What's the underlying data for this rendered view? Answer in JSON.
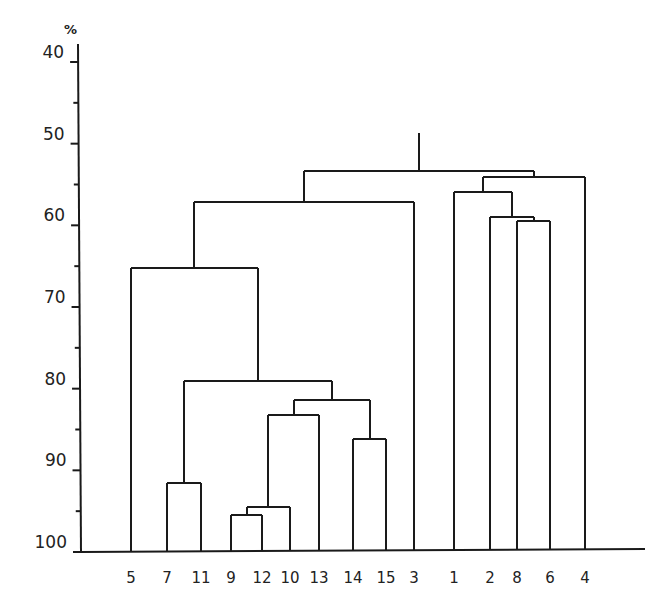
{
  "chart_data": {
    "type": "dendrogram",
    "title": "",
    "xlabel": "",
    "ylabel": "%",
    "ylim": [
      40,
      100
    ],
    "y_axis_inverted": true,
    "y_ticks": [
      40,
      50,
      60,
      70,
      80,
      90,
      100
    ],
    "y_minor_ticks": [
      45,
      55,
      65,
      75,
      85,
      95
    ],
    "leaf_order": [
      "5",
      "7",
      "11",
      "9",
      "12",
      "10",
      "13",
      "14",
      "15",
      "3",
      "1",
      "2",
      "8",
      "6",
      "4"
    ],
    "merges": [
      {
        "id": "A",
        "children": [
          "9",
          "12"
        ],
        "similarity": 95.5
      },
      {
        "id": "B",
        "children": [
          "A",
          "10"
        ],
        "similarity": 94.5
      },
      {
        "id": "C",
        "children": [
          "7",
          "11"
        ],
        "similarity": 91.5
      },
      {
        "id": "D",
        "children": [
          "14",
          "15"
        ],
        "similarity": 86.2
      },
      {
        "id": "E",
        "children": [
          "B",
          "13"
        ],
        "similarity": 83.2
      },
      {
        "id": "F",
        "children": [
          "E",
          "D"
        ],
        "similarity": 81.4
      },
      {
        "id": "G",
        "children": [
          "C",
          "F"
        ],
        "similarity": 79.0
      },
      {
        "id": "H",
        "children": [
          "5",
          "G"
        ],
        "similarity": 65.2
      },
      {
        "id": "I",
        "children": [
          "H",
          "3"
        ],
        "similarity": 57.2
      },
      {
        "id": "J",
        "children": [
          "8",
          "6"
        ],
        "similarity": 59.5
      },
      {
        "id": "K",
        "children": [
          "2",
          "J"
        ],
        "similarity": 59.0
      },
      {
        "id": "L",
        "children": [
          "1",
          "K"
        ],
        "similarity": 55.9
      },
      {
        "id": "M",
        "children": [
          "L",
          "4"
        ],
        "similarity": 54.1
      },
      {
        "id": "N",
        "children": [
          "I",
          "M"
        ],
        "similarity": 53.4
      }
    ],
    "root_stem_top": 48.7
  },
  "axis": {
    "unit_label": "%",
    "tick_labels": [
      "40",
      "50",
      "60",
      "70",
      "80",
      "90",
      "100"
    ]
  }
}
